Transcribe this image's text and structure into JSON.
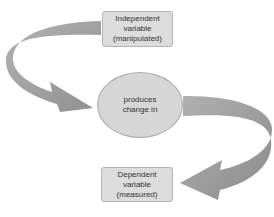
{
  "diagram": {
    "type": "flow",
    "colors": {
      "box_fill": "#dcdcdc",
      "circle_fill": "#d6d6d6",
      "arrow": "#9a9a9a",
      "text": "#333333"
    },
    "nodes": {
      "independent": {
        "lines": [
          "Independent",
          "variable",
          "(manipulated)"
        ]
      },
      "relation": {
        "lines": [
          "produces",
          "change in"
        ]
      },
      "dependent": {
        "lines": [
          "Dependent",
          "variable",
          "(measured)"
        ]
      }
    },
    "edges": [
      {
        "from": "independent",
        "to": "relation"
      },
      {
        "from": "relation",
        "to": "dependent"
      }
    ]
  }
}
